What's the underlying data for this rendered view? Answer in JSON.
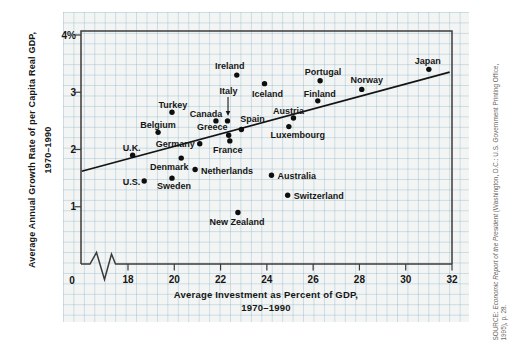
{
  "colors": {
    "ink": "#161616",
    "frame": "#3b3b3b",
    "paper": "#f2f5f3",
    "grid_line": "#b9cfdc",
    "trend_line": "#141414",
    "source_text": "#6b6662"
  },
  "y_axis_title": {
    "line1": "Average Annual Growth Rate of per Capita Real GDP,",
    "line2": "1970–1990"
  },
  "x_axis_title": {
    "line1": "Average Investment as Percent of GDP,",
    "line2": "1970–1990"
  },
  "source": {
    "prefix": "SOURCE: ",
    "title": "Economic Report of the President",
    "suffix": " (Washington, D.C.: U.S. Government Printing Office,",
    "line2": "1995), p. 28."
  },
  "chart_data": {
    "type": "scatter",
    "title": "",
    "xlabel": "Average Investment as Percent of GDP, 1970–1990",
    "ylabel": "Average Annual Growth Rate of per Capita Real GDP, 1970–1990",
    "xlim": [
      16,
      32
    ],
    "ylim": [
      0,
      4
    ],
    "grid": true,
    "axis_break_on_x": true,
    "x_axis": {
      "origin_label": "0",
      "ticks": [
        {
          "label": "18",
          "value": 18
        },
        {
          "label": "20",
          "value": 20
        },
        {
          "label": "22",
          "value": 22
        },
        {
          "label": "24",
          "value": 24
        },
        {
          "label": "26",
          "value": 26
        },
        {
          "label": "28",
          "value": 28
        },
        {
          "label": "30",
          "value": 30
        },
        {
          "label": "32",
          "value": 32
        }
      ]
    },
    "y_axis": {
      "origin_label": "0",
      "ticks": [
        {
          "label": "4%",
          "value": 4
        },
        {
          "label": "3",
          "value": 3
        },
        {
          "label": "2",
          "value": 2
        },
        {
          "label": "1",
          "value": 1
        }
      ]
    },
    "trendline": {
      "x1": 16.0,
      "y1": 1.62,
      "x2": 31.9,
      "y2": 3.35
    },
    "points": [
      {
        "name": "U.K.",
        "x": 18.2,
        "y": 1.9,
        "label": {
          "dx": -1,
          "dy": -4.5,
          "anchor": "middle"
        }
      },
      {
        "name": "U.S.",
        "x": 18.7,
        "y": 1.45,
        "label": {
          "dx": -4,
          "dy": 4,
          "anchor": "end"
        }
      },
      {
        "name": "Belgium",
        "x": 19.3,
        "y": 2.3,
        "label": {
          "dx": 0,
          "dy": -4.5,
          "anchor": "middle"
        }
      },
      {
        "name": "Sweden",
        "x": 19.9,
        "y": 1.5,
        "label": {
          "dx": 2,
          "dy": 10.5,
          "anchor": "middle"
        }
      },
      {
        "name": "Turkey",
        "x": 19.9,
        "y": 2.65,
        "label": {
          "dx": 1,
          "dy": -4.5,
          "anchor": "middle"
        }
      },
      {
        "name": "Denmark",
        "x": 20.3,
        "y": 1.85,
        "label": {
          "dx": -12,
          "dy": 12,
          "anchor": "middle"
        }
      },
      {
        "name": "Netherlands",
        "x": 20.9,
        "y": 1.65,
        "label": {
          "dx": 6,
          "dy": 4,
          "anchor": "start"
        }
      },
      {
        "name": "Germany",
        "x": 21.1,
        "y": 2.1,
        "label": {
          "dx": -5,
          "dy": 3,
          "anchor": "end"
        }
      },
      {
        "name": "Canada",
        "x": 21.8,
        "y": 2.5,
        "label": {
          "dx": -10,
          "dy": -4,
          "anchor": "middle"
        }
      },
      {
        "name": "Greece",
        "x": 22.35,
        "y": 2.25,
        "label": {
          "dx": -16.5,
          "dy": -5,
          "anchor": "middle"
        }
      },
      {
        "name": "France",
        "x": 22.4,
        "y": 2.15,
        "label": {
          "dx": -2,
          "dy": 12.5,
          "anchor": "middle"
        }
      },
      {
        "name": "Italy",
        "x": 22.3,
        "y": 2.5,
        "label": {
          "dx": 1,
          "dy": -27,
          "anchor": "middle"
        },
        "arrow": true
      },
      {
        "name": "Ireland",
        "x": 22.7,
        "y": 3.3,
        "label": {
          "dx": -7,
          "dy": -6.5,
          "anchor": "middle"
        }
      },
      {
        "name": "Spain",
        "x": 22.9,
        "y": 2.35,
        "label": {
          "dx": 11,
          "dy": -7,
          "anchor": "middle"
        }
      },
      {
        "name": "New Zealand",
        "x": 22.75,
        "y": 0.9,
        "label": {
          "dx": -1,
          "dy": 12.5,
          "anchor": "middle"
        }
      },
      {
        "name": "Iceland",
        "x": 23.9,
        "y": 3.15,
        "label": {
          "dx": 3,
          "dy": 13.5,
          "anchor": "middle"
        }
      },
      {
        "name": "Australia",
        "x": 24.2,
        "y": 1.55,
        "label": {
          "dx": 6,
          "dy": 4,
          "anchor": "start"
        }
      },
      {
        "name": "Luxembourg",
        "x": 24.95,
        "y": 2.4,
        "label": {
          "dx": 9,
          "dy": 11,
          "anchor": "middle"
        }
      },
      {
        "name": "Austria",
        "x": 25.15,
        "y": 2.55,
        "label": {
          "dx": -5,
          "dy": -4,
          "anchor": "middle"
        }
      },
      {
        "name": "Switzerland",
        "x": 24.9,
        "y": 1.2,
        "label": {
          "dx": 6,
          "dy": 4,
          "anchor": "start"
        }
      },
      {
        "name": "Portugal",
        "x": 26.3,
        "y": 3.2,
        "label": {
          "dx": 3,
          "dy": -5.5,
          "anchor": "middle"
        }
      },
      {
        "name": "Finland",
        "x": 26.2,
        "y": 2.85,
        "label": {
          "dx": 2,
          "dy": -4,
          "anchor": "middle"
        }
      },
      {
        "name": "Norway",
        "x": 28.1,
        "y": 3.05,
        "label": {
          "dx": 5,
          "dy": -6,
          "anchor": "middle"
        }
      },
      {
        "name": "Japan",
        "x": 31.0,
        "y": 3.4,
        "label": {
          "dx": -1,
          "dy": -5,
          "anchor": "middle"
        }
      }
    ]
  }
}
